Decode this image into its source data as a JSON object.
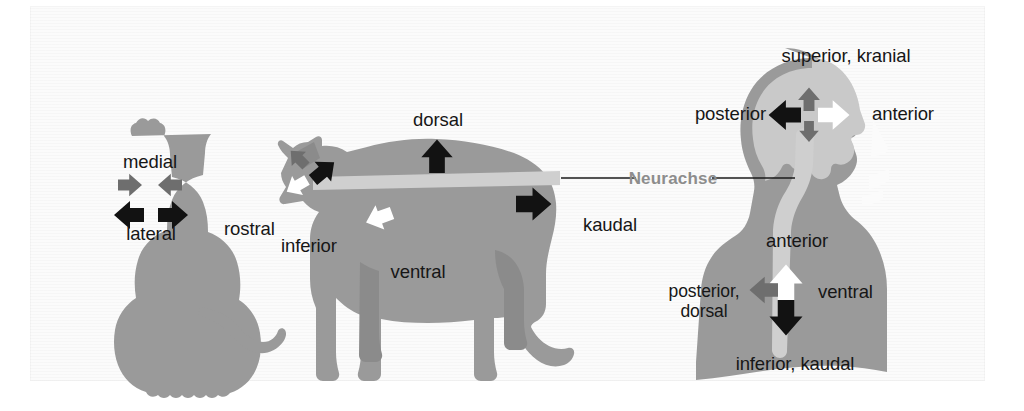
{
  "figure": {
    "background_color": "#fbfbfb",
    "page_color": "#ffffff"
  },
  "palette": {
    "body_gray": "#9a9a9a",
    "body_gray_dark": "#8b8b8b",
    "brain_light": "#c9c9c9",
    "neuraxis_light": "#cfcfcf",
    "arrow_black": "#121212",
    "arrow_dark_gray": "#6e6e6e",
    "arrow_white": "#ffffff",
    "text_black": "#161616",
    "neurachse_text": "#8d8d8d",
    "leader_line": "#1a1a1a"
  },
  "panels": [
    {
      "id": "dog-rear",
      "name": "dog-rear-view",
      "description": "Hund von hinten",
      "labels": [
        {
          "key": "medial",
          "text": "medial"
        },
        {
          "key": "lateral",
          "text": "lateral"
        }
      ],
      "arrows": [
        {
          "name": "medial-arrow-right",
          "direction": "right",
          "color": "dark-gray"
        },
        {
          "name": "medial-arrow-left",
          "direction": "left",
          "color": "dark-gray"
        },
        {
          "name": "lateral-arrow-left",
          "direction": "left",
          "color": "black"
        },
        {
          "name": "lateral-arrow-right",
          "direction": "right",
          "color": "black"
        }
      ]
    },
    {
      "id": "dog-side",
      "name": "dog-side-view",
      "description": "Hund von der Seite mit Neurachse",
      "labels": [
        {
          "key": "dorsal",
          "text": "dorsal"
        },
        {
          "key": "ventral",
          "text": "ventral"
        },
        {
          "key": "rostral",
          "text": "rostral"
        },
        {
          "key": "inferior",
          "text": "inferior"
        },
        {
          "key": "kaudal",
          "text": "kaudal"
        }
      ],
      "arrows": [
        {
          "name": "dorsal-arrow",
          "direction": "up",
          "color": "black"
        },
        {
          "name": "ventral-arrow",
          "direction": "down-left",
          "color": "white"
        },
        {
          "name": "kaudal-arrow",
          "direction": "right",
          "color": "black"
        },
        {
          "name": "rostral-arrow",
          "direction": "up-left",
          "color": "dark-gray"
        },
        {
          "name": "head-arrow-black",
          "direction": "up-right",
          "color": "black"
        },
        {
          "name": "head-arrow-white",
          "direction": "down-left",
          "color": "white"
        }
      ]
    },
    {
      "id": "human",
      "name": "human-head-and-torso",
      "description": "Mensch Kopf und Rumpf mit Gehirn und Neurachse",
      "labels": [
        {
          "key": "superior_kranial",
          "text": "superior, kranial"
        },
        {
          "key": "posterior",
          "text": "posterior"
        },
        {
          "key": "anterior_head",
          "text": "anterior"
        },
        {
          "key": "anterior_body",
          "text": "anterior"
        },
        {
          "key": "posterior_dorsal",
          "text": "posterior,\ndorsal"
        },
        {
          "key": "ventral",
          "text": "ventral"
        },
        {
          "key": "inferior_kaudal",
          "text": "inferior, kaudal"
        }
      ],
      "arrows": [
        {
          "name": "brain-arrow-up",
          "direction": "up",
          "color": "dark-gray"
        },
        {
          "name": "brain-arrow-left",
          "direction": "left",
          "color": "black"
        },
        {
          "name": "brain-arrow-right",
          "direction": "right",
          "color": "white"
        },
        {
          "name": "brain-arrow-down",
          "direction": "down",
          "color": "dark-gray"
        },
        {
          "name": "body-arrow-up",
          "direction": "up",
          "color": "white"
        },
        {
          "name": "body-arrow-left",
          "direction": "left",
          "color": "dark-gray"
        },
        {
          "name": "body-arrow-down",
          "direction": "down",
          "color": "black"
        }
      ]
    }
  ],
  "annotation": {
    "neurachse_label": "Neurachse",
    "has_leader_left": true,
    "has_leader_right": true
  }
}
